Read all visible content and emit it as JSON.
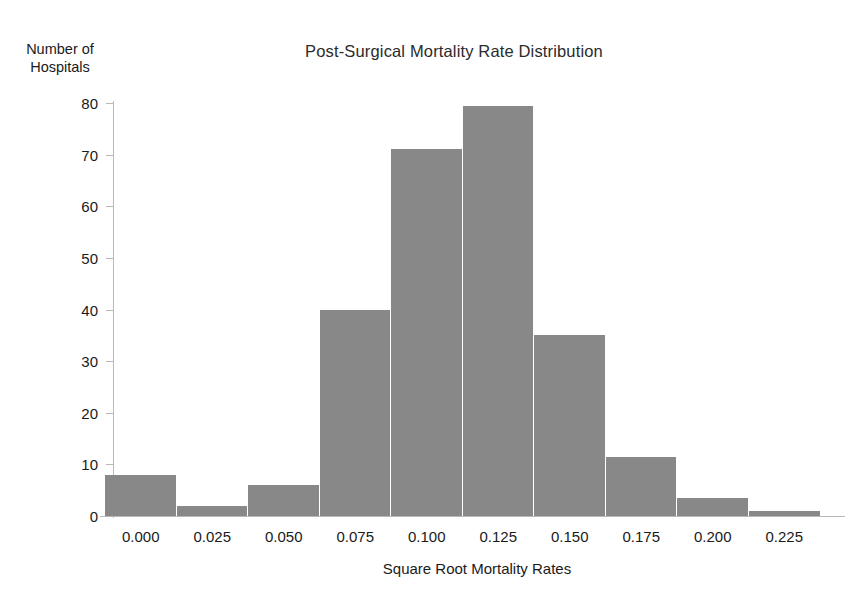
{
  "chart_data": {
    "type": "bar",
    "title": "Post-Surgical Mortality Rate Distribution",
    "xlabel": "Square Root Mortality Rates",
    "ylabel": "Number of Hospitals",
    "ylabel_lines": [
      "Number of",
      "Hospitals"
    ],
    "categories": [
      "0.000",
      "0.025",
      "0.050",
      "0.075",
      "0.100",
      "0.125",
      "0.150",
      "0.175",
      "0.200",
      "0.225"
    ],
    "x": [
      0.0,
      0.025,
      0.05,
      0.075,
      0.1,
      0.125,
      0.15,
      0.175,
      0.2,
      0.225
    ],
    "values": [
      8,
      2,
      6,
      40,
      71,
      79.5,
      35,
      11.5,
      3.5,
      1
    ],
    "xtick_labels": [
      "0.000",
      "0.025",
      "0.050",
      "0.075",
      "0.100",
      "0.125",
      "0.150",
      "0.175",
      "0.200",
      "0.225"
    ],
    "ytick_labels": [
      "80",
      "70",
      "60",
      "50",
      "40",
      "30",
      "20",
      "10",
      "0"
    ],
    "ytick_values": [
      80,
      70,
      60,
      50,
      40,
      30,
      20,
      10,
      0
    ],
    "ylim": [
      0,
      80
    ],
    "xlim": [
      -0.0125,
      0.2375
    ],
    "bin_width": 0.025,
    "grid": false,
    "legend": false,
    "bar_color": "#888888",
    "axis_color": "#b9b9b9",
    "text_color": "#1a1a1a",
    "background": "#ffffff"
  }
}
